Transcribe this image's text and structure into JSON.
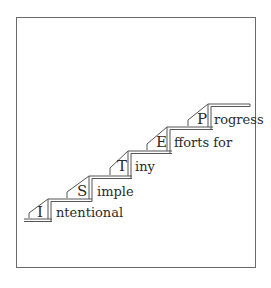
{
  "diagram": {
    "type": "staircase",
    "steps": [
      {
        "letter": "I",
        "rest": "ntentional"
      },
      {
        "letter": "S",
        "rest": "imple"
      },
      {
        "letter": "T",
        "rest": "iny"
      },
      {
        "letter": "E",
        "rest": "fforts for"
      },
      {
        "letter": "P",
        "rest": "rogress"
      }
    ],
    "acronym": "ISTEP",
    "line_color": "#555555",
    "text_color": "#2b2b2b"
  }
}
